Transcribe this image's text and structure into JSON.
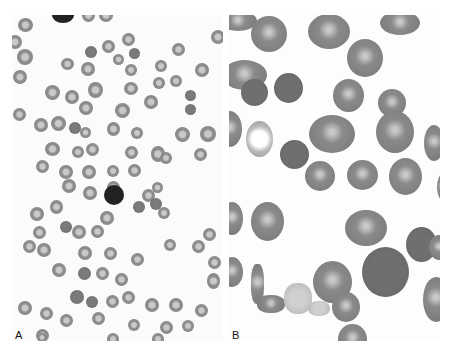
{
  "figure": {
    "panels": [
      {
        "id": "A",
        "label": "A",
        "description": "Low-power peripheral blood smear with many red cells and a single dark nucleated cell"
      },
      {
        "id": "B",
        "label": "B",
        "description": "High-power view of red cells with varied shapes and sizes"
      }
    ]
  },
  "colors": {
    "background": "#ffffff",
    "cell_gray": "#888888",
    "dark_cell": "#111111",
    "label": "#111111"
  }
}
